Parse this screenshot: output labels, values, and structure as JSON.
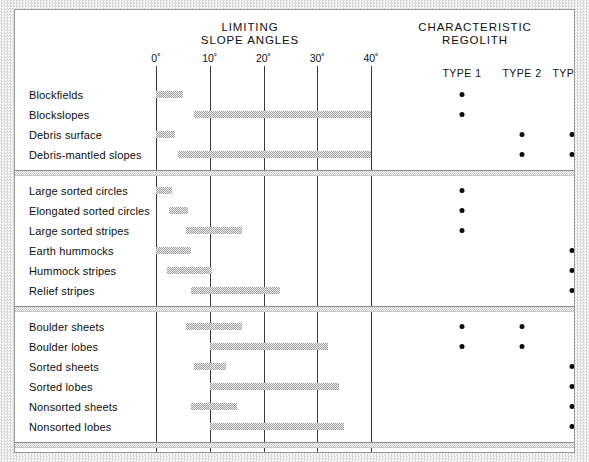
{
  "headers": {
    "slope_angles": "LIMITING\nSLOPE ANGLES",
    "regolith": "CHARACTERISTIC\nREGOLITH"
  },
  "regolith_columns": [
    {
      "label": "TYPE 1",
      "x": 447
    },
    {
      "label": "TYPE 2",
      "x": 507
    },
    {
      "label": "TYPE 3",
      "x": 557
    }
  ],
  "axis": {
    "ticks": [
      "0˚",
      "10˚",
      "20˚",
      "30˚",
      "40˚"
    ],
    "values": [
      0,
      10,
      20,
      30,
      40
    ],
    "min": 0,
    "max": 40,
    "unit": "degrees"
  },
  "not_applicable_label": "Not applicable",
  "chart_data": {
    "type": "bar",
    "title": "LIMITING SLOPE ANGLES",
    "xlabel": "Slope angle (degrees)",
    "ylabel": "",
    "xlim": [
      -2,
      42
    ],
    "grid": true,
    "orientation": "horizontal-range",
    "legend": "CHARACTERISTIC REGOLITH (TYPE 1 / TYPE 2 / TYPE 3)",
    "groups": [
      {
        "name": "Blockfields and slopes",
        "rows": [
          {
            "label": "Blockfields",
            "start": 0.0,
            "end": 5.0,
            "regolith": [
              true,
              false,
              false
            ]
          },
          {
            "label": "Blockslopes",
            "start": 7.0,
            "end": 40.0,
            "regolith": [
              true,
              false,
              false
            ]
          },
          {
            "label": "Debris surface",
            "start": 0.0,
            "end": 3.5,
            "regolith": [
              false,
              true,
              true
            ]
          },
          {
            "label": "Debris-mantled slopes",
            "start": 4.0,
            "end": 40.0,
            "regolith": [
              false,
              true,
              true
            ]
          }
        ]
      },
      {
        "name": "Patterned ground",
        "rows": [
          {
            "label": "Large sorted circles",
            "start": 0.0,
            "end": 3.0,
            "regolith": [
              true,
              false,
              false
            ]
          },
          {
            "label": "Elongated sorted circles",
            "start": 2.5,
            "end": 6.0,
            "regolith": [
              true,
              false,
              false
            ]
          },
          {
            "label": "Large sorted stripes",
            "start": 5.5,
            "end": 16.0,
            "regolith": [
              true,
              false,
              false
            ]
          },
          {
            "label": "Earth hummocks",
            "start": 0.0,
            "end": 6.5,
            "regolith": [
              false,
              false,
              true
            ]
          },
          {
            "label": "Hummock stripes",
            "start": 2.0,
            "end": 10.5,
            "regolith": [
              false,
              false,
              true
            ]
          },
          {
            "label": "Relief stripes",
            "start": 6.5,
            "end": 23.0,
            "regolith": [
              false,
              false,
              true
            ]
          }
        ]
      },
      {
        "name": "Sheets and lobes",
        "rows": [
          {
            "label": "Boulder sheets",
            "start": 5.5,
            "end": 16.0,
            "regolith": [
              true,
              true,
              false
            ]
          },
          {
            "label": "Boulder lobes",
            "start": 10.0,
            "end": 32.0,
            "regolith": [
              true,
              true,
              false
            ]
          },
          {
            "label": "Sorted sheets",
            "start": 7.0,
            "end": 13.0,
            "regolith": [
              false,
              false,
              true
            ]
          },
          {
            "label": "Sorted lobes",
            "start": 10.0,
            "end": 34.0,
            "regolith": [
              false,
              false,
              true
            ]
          },
          {
            "label": "Nonsorted sheets",
            "start": 6.5,
            "end": 15.0,
            "regolith": [
              false,
              false,
              true
            ]
          },
          {
            "label": "Nonsorted lobes",
            "start": 10.0,
            "end": 35.0,
            "regolith": [
              false,
              false,
              true
            ]
          }
        ]
      },
      {
        "name": "Talus and rock glaciers",
        "not_applicable": true,
        "rows": [
          {
            "label": "Talus slopes",
            "start": 5.0,
            "end": 34.0,
            "regolith": [
              false,
              false,
              false
            ]
          },
          {
            "label": "Protalus ramparts",
            "start": 0.0,
            "end": 13.0,
            "regolith": [
              false,
              false,
              false
            ]
          },
          {
            "label": "Rock glaciers",
            "start": 3.0,
            "end": 13.5,
            "regolith": [
              false,
              false,
              false
            ]
          }
        ]
      },
      {
        "name": "Nivation",
        "rows": [
          {
            "label": "Nivation hollows",
            "start": 8.0,
            "end": 16.0,
            "regolith": [
              false,
              true,
              true
            ]
          }
        ]
      }
    ]
  },
  "colors": {
    "bar": "#9e9e9e",
    "gridline": "#3a3a3a",
    "text": "#101010",
    "dot": "#0a0a0a",
    "frame": "#9a9a9a"
  }
}
